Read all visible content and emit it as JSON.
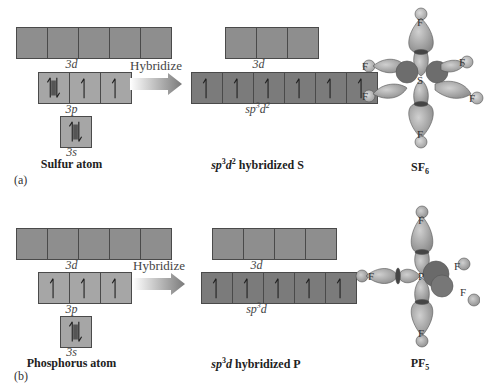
{
  "panel_a": {
    "letter": "(a)",
    "atom": {
      "caption": "Sulfur atom",
      "orbitals": [
        {
          "label_main": "3",
          "label_sub": "d",
          "boxes": [
            "",
            "",
            "",
            "",
            ""
          ]
        },
        {
          "label_main": "3",
          "label_sub": "p",
          "boxes": [
            "paired",
            "up",
            "up"
          ]
        },
        {
          "label_main": "3",
          "label_sub": "s",
          "boxes": [
            "paired"
          ]
        }
      ]
    },
    "arrow_label": "Hybridize",
    "hybrid": {
      "d_label_main": "3",
      "d_label_sub": "d",
      "d_boxes": [
        "",
        "",
        ""
      ],
      "hyb_label": "sp3d2",
      "hyb_label_parts": {
        "a": "sp",
        "sup1": "3",
        "b": "d",
        "sup2": "2"
      },
      "hyb_boxes": [
        "up",
        "up",
        "up",
        "up",
        "up",
        "up"
      ],
      "caption_parts": {
        "a": "sp",
        "sup1": "3",
        "b": "d",
        "sup2": "2",
        "rest": " hybridized S"
      }
    },
    "molecule": {
      "central": "S",
      "ligand": "F",
      "caption_main": "SF",
      "caption_sub": "6"
    }
  },
  "panel_b": {
    "letter": "(b)",
    "atom": {
      "caption": "Phosphorus atom",
      "orbitals": [
        {
          "label_main": "3",
          "label_sub": "d",
          "boxes": [
            "",
            "",
            "",
            "",
            ""
          ]
        },
        {
          "label_main": "3",
          "label_sub": "p",
          "boxes": [
            "up",
            "up",
            "up"
          ]
        },
        {
          "label_main": "3",
          "label_sub": "s",
          "boxes": [
            "paired"
          ]
        }
      ]
    },
    "arrow_label": "Hybridize",
    "hybrid": {
      "d_label_main": "3",
      "d_label_sub": "d",
      "d_boxes": [
        "",
        "",
        "",
        ""
      ],
      "hyb_label_parts": {
        "a": "sp",
        "sup1": "3",
        "b": "d"
      },
      "hyb_boxes": [
        "up",
        "up",
        "up",
        "up",
        "up"
      ],
      "caption_parts": {
        "a": "sp",
        "sup1": "3",
        "b": "d",
        "rest": " hybridized P"
      }
    },
    "molecule": {
      "central": "P",
      "ligand": "F",
      "caption_main": "PF",
      "caption_sub": "5"
    }
  }
}
